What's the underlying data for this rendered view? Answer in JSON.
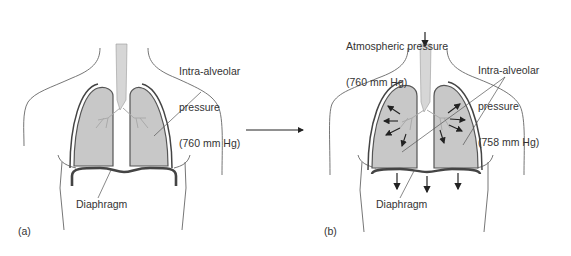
{
  "figure": {
    "colors": {
      "lung_fill": "#c8c8c8",
      "outline": "#555555",
      "diaphragm": "#444444",
      "text": "#333333",
      "background": "#ffffff"
    },
    "panel_a": {
      "label": "(a)",
      "intra_alveolar_label_line1": "Intra-alveolar",
      "intra_alveolar_label_line2": "pressure",
      "intra_alveolar_value": "(760 mm Hg)",
      "diaphragm_label": "Diaphragm"
    },
    "transition_arrow": "right-arrow",
    "panel_b": {
      "label": "(b)",
      "atmospheric_label_line1": "Atmospheric pressure",
      "atmospheric_value": "(760 mm Hg)",
      "intra_alveolar_label_line1": "Intra-alveolar",
      "intra_alveolar_label_line2": "pressure",
      "intra_alveolar_value": "(758 mm Hg)",
      "diaphragm_label": "Diaphragm"
    }
  }
}
